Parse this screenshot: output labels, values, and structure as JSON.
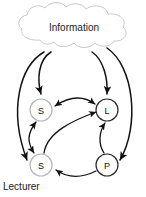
{
  "figure": {
    "caption": "Lecturer",
    "cloud": {
      "label": "Information",
      "stroke_color": "#c9c9c9"
    },
    "nodes": [
      {
        "id": "s-top",
        "label": "S",
        "cx": 41,
        "cy": 110,
        "r": 11,
        "style": "light"
      },
      {
        "id": "l",
        "label": "L",
        "cx": 107,
        "cy": 110,
        "r": 11,
        "style": "dark"
      },
      {
        "id": "s-bottom",
        "label": "S",
        "cx": 41,
        "cy": 165,
        "r": 11,
        "style": "light"
      },
      {
        "id": "p",
        "label": "P",
        "cx": 107,
        "cy": 165,
        "r": 11,
        "style": "dark"
      }
    ],
    "edges": [
      {
        "id": "cloud-to-s-top",
        "from": "Information",
        "to": "S (top)",
        "direction": "one-way"
      },
      {
        "id": "cloud-to-l",
        "from": "Information",
        "to": "L",
        "direction": "one-way"
      },
      {
        "id": "cloud-to-s-bottom",
        "from": "Information",
        "to": "S (bottom)",
        "direction": "one-way"
      },
      {
        "id": "cloud-to-p",
        "from": "Information",
        "to": "P",
        "direction": "one-way"
      },
      {
        "id": "s-top-l",
        "from": "S (top)",
        "to": "L",
        "direction": "two-way"
      },
      {
        "id": "s-top-s-bottom",
        "from": "S (top)",
        "to": "S (bottom)",
        "direction": "two-way"
      },
      {
        "id": "s-bottom-to-l",
        "from": "S (bottom)",
        "to": "L",
        "direction": "one-way"
      },
      {
        "id": "p-to-l",
        "from": "P",
        "to": "L",
        "direction": "one-way"
      },
      {
        "id": "p-to-s-bottom",
        "from": "P",
        "to": "S (bottom)",
        "direction": "one-way"
      }
    ],
    "colors": {
      "arrow": "#111111",
      "node_dark": "#2b2b2b",
      "node_light": "#b5b5b5",
      "background": "#ffffff"
    }
  }
}
